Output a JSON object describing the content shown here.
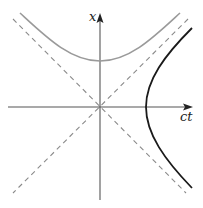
{
  "diagram": {
    "axes": {
      "horizontal_label": "ct",
      "vertical_label": "x"
    },
    "colors": {
      "axis": "#333333",
      "asymptote": "#8a8a8a",
      "upper_hyperbola": "#9a9a9a",
      "right_hyperbola": "#1a1a1a",
      "background": "#ffffff"
    },
    "curves": [
      {
        "name": "upper-hyperbola",
        "style": "solid gray",
        "vertex": "on x axis above origin"
      },
      {
        "name": "right-hyperbola",
        "style": "solid black",
        "vertex": "on ct axis right of origin"
      },
      {
        "name": "asymptote-positive",
        "style": "dashed gray"
      },
      {
        "name": "asymptote-negative",
        "style": "dashed gray"
      }
    ]
  }
}
